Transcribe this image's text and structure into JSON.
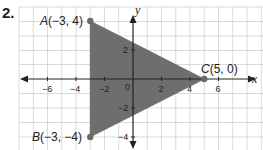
{
  "problem": {
    "number": "2."
  },
  "graph": {
    "x_axis_label": "x",
    "y_axis_label": "y",
    "origin_label": "0",
    "x_tick_labels": [
      {
        "value": -6,
        "label": "−6"
      },
      {
        "value": -4,
        "label": "−4"
      },
      {
        "value": -2,
        "label": "−2"
      },
      {
        "value": 2,
        "label": "2"
      },
      {
        "value": 4,
        "label": "4"
      },
      {
        "value": 6,
        "label": "6"
      }
    ],
    "y_tick_labels": [
      {
        "value": 2,
        "label": "2"
      },
      {
        "value": -2,
        "label": "−2"
      },
      {
        "value": -4,
        "label": "−4"
      }
    ],
    "points": [
      {
        "name": "A",
        "coords": "(−3, 4)",
        "x": -3,
        "y": 4
      },
      {
        "name": "B",
        "coords": "(−3, −4)",
        "x": -3,
        "y": -4
      },
      {
        "name": "C",
        "coords": "(5, 0)",
        "x": 5,
        "y": 0
      }
    ],
    "colors": {
      "fill": "#6e6e6e",
      "grid": "#cfcfcf",
      "axis": "#222222",
      "point": "#6a6a6a"
    }
  }
}
